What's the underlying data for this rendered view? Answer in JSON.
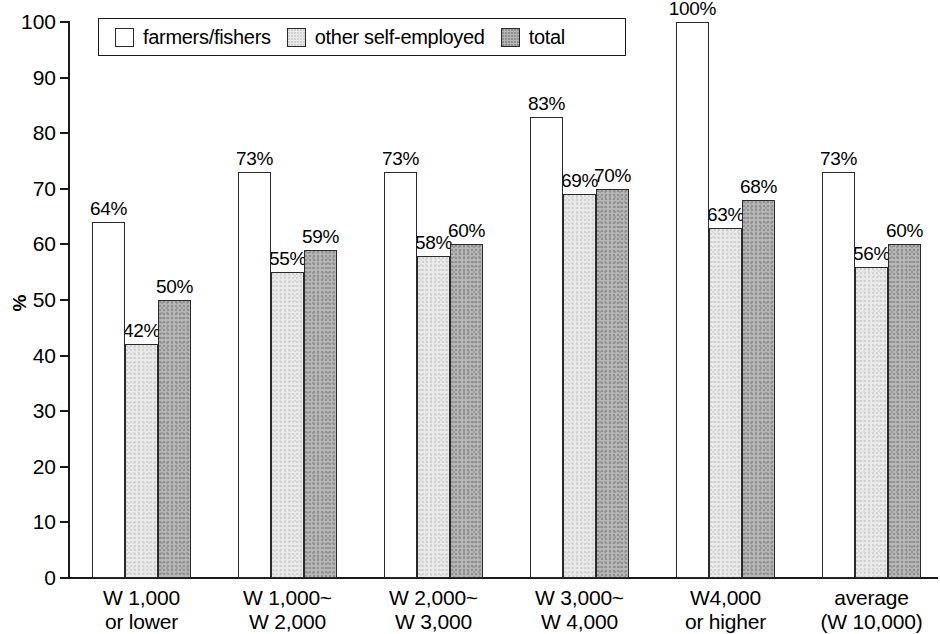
{
  "chart_data": {
    "type": "bar",
    "title": "",
    "subtitle": "",
    "xlabel": "",
    "ylabel": "%",
    "ylim": [
      0,
      100
    ],
    "ytick_labels": [
      "100",
      "90",
      "80",
      "70",
      "60",
      "50",
      "40",
      "30",
      "20",
      "10",
      "0"
    ],
    "ytick_values": [
      100,
      90,
      80,
      70,
      60,
      50,
      40,
      30,
      20,
      10,
      0
    ],
    "ytick_step": 10,
    "grid": false,
    "legend_position": "top-left-inside",
    "bar_label_suffix": "%",
    "categories": [
      "W 1,000\nor lower",
      "W 1,000~\nW 2,000",
      "W 2,000~\nW 3,000",
      "W 3,000~\nW 4,000",
      "W4,000\nor higher",
      "average\n(W 10,000)"
    ],
    "series": [
      {
        "name": "farmers/fishers",
        "color": "#ffffff",
        "values": [
          64,
          73,
          73,
          83,
          100,
          73
        ],
        "labels": [
          "64%",
          "73%",
          "73%",
          "83%",
          "100%",
          "73%"
        ]
      },
      {
        "name": "other self-employed",
        "color": "#eaeaea",
        "values": [
          42,
          55,
          58,
          69,
          63,
          56
        ],
        "labels": [
          "42%",
          "55%",
          "58%",
          "69%",
          "63%",
          "56%"
        ]
      },
      {
        "name": "total",
        "color": "#b6b6b6",
        "values": [
          50,
          59,
          60,
          70,
          68,
          60
        ],
        "labels": [
          "50%",
          "59%",
          "60%",
          "70%",
          "68%",
          "60%"
        ]
      }
    ]
  },
  "legend": {
    "entries": [
      {
        "label": "farmers/fishers"
      },
      {
        "label": "other self-employed"
      },
      {
        "label": "total"
      }
    ]
  }
}
